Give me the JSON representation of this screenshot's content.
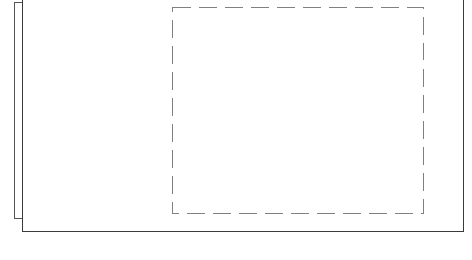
{
  "figure": {
    "background_color": "#ffffff",
    "width": 472,
    "height": 260
  },
  "shapes": {
    "back_plane": {
      "name": "back-plane",
      "style": "solid",
      "stroke_color": "#555555",
      "stroke_width": 1.2,
      "x": 14,
      "y": 2,
      "width": 50,
      "height": 216,
      "note": "offset rectangle behind front plane, top and right cropped by front plane"
    },
    "front_plane": {
      "name": "front-plane",
      "style": "solid",
      "stroke_color": "#3a3a3a",
      "stroke_width": 1.4,
      "x": 22,
      "y": -10,
      "width": 441,
      "height": 241,
      "note": "main page rectangle, top edge cropped above image boundary"
    },
    "placeholder_region": {
      "name": "dashed-placeholder",
      "style": "dashed",
      "stroke_color": "#808080",
      "stroke_width": 1.3,
      "dash_length": 18,
      "gap_length": 8,
      "x": 172,
      "y": 7,
      "width": 251,
      "height": 206,
      "note": "dashed content placeholder box inside the front plane"
    }
  },
  "paths": {
    "back_plane_d": "M 22.5 2.5 L 14.5 2.5 L 14.5 218.5 L 22.5 218.5",
    "front_plane_d": "M 22.5 -10 L 22.5 231.5 L 463.5 231.5 L 463.5 -10",
    "placeholder_d": "M 172.5 7.5 L 423.5 7.5 L 423.5 213.5 L 172.5 213.5 Z"
  }
}
